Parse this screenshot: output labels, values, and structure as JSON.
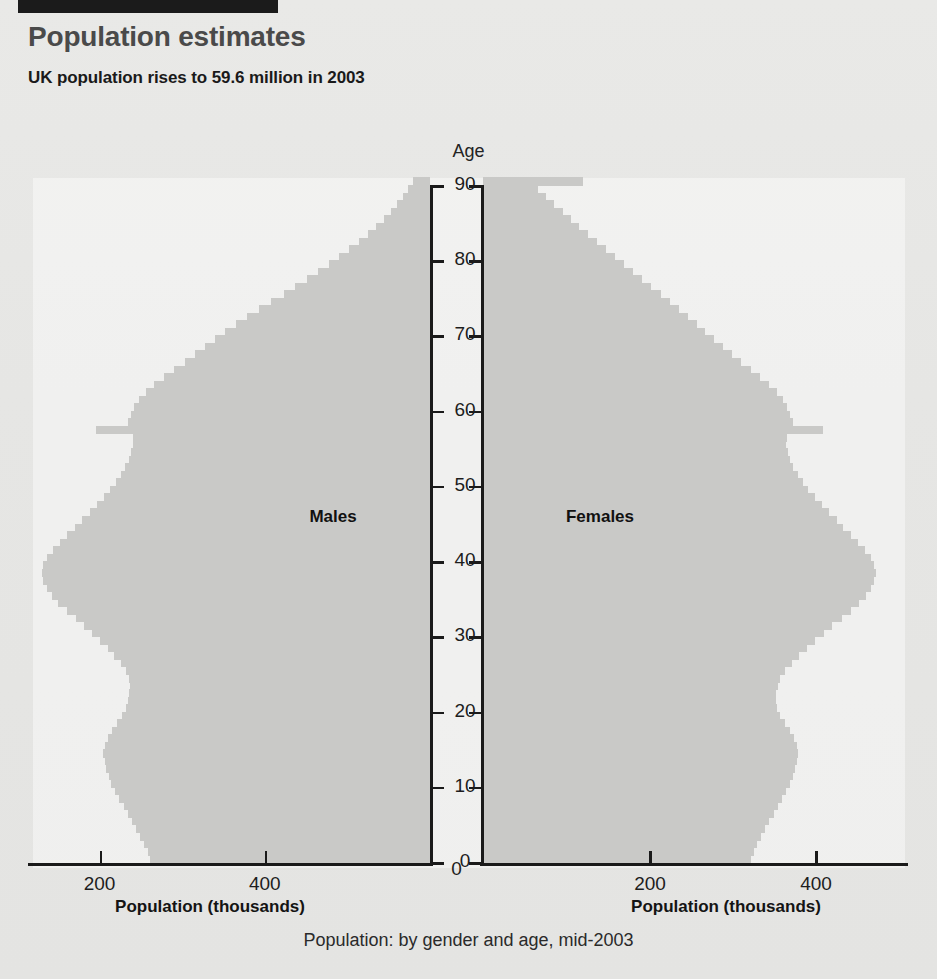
{
  "header": {
    "title": "Population estimates",
    "subtitle": "UK population rises to 59.6 million in 2003"
  },
  "caption": "Population: by gender and age, mid-2003",
  "colors": {
    "bar_fill": "#c9c9c7",
    "axis": "#1a1a1a",
    "title_text": "#4a4a4a",
    "body_text": "#1a1a1a",
    "page_background": "#e8e8e6",
    "plot_background": "#f4f4f2",
    "rule_bar": "#1b1b1b"
  },
  "chart_data": {
    "type": "bar",
    "orientation": "horizontal",
    "subtype": "population-pyramid",
    "title": "Population: by gender and age, mid-2003",
    "ylabel": "Age",
    "xlabel_left": "Population (thousands)",
    "xlabel_right": "Population (thousands)",
    "left_series_label": "Males",
    "right_series_label": "Females",
    "grid": false,
    "legend_position": "inside-panels",
    "ylim": [
      0,
      90
    ],
    "ytick_labels": [
      "0",
      "10",
      "20",
      "30",
      "40",
      "50",
      "60",
      "70",
      "80",
      "90"
    ],
    "yticks": [
      0,
      10,
      20,
      30,
      40,
      50,
      60,
      70,
      80,
      90
    ],
    "xlim_left": [
      0,
      480
    ],
    "xlim_right": [
      0,
      500
    ],
    "xticks_left": [
      200,
      400
    ],
    "xtick_labels_left": [
      "400",
      "200"
    ],
    "xticks_right": [
      200,
      400
    ],
    "xtick_labels_right": [
      "200",
      "400"
    ],
    "xtick_zero_label": "0",
    "ages": [
      0,
      1,
      2,
      3,
      4,
      5,
      6,
      7,
      8,
      9,
      10,
      11,
      12,
      13,
      14,
      15,
      16,
      17,
      18,
      19,
      20,
      21,
      22,
      23,
      24,
      25,
      26,
      27,
      28,
      29,
      30,
      31,
      32,
      33,
      34,
      35,
      36,
      37,
      38,
      39,
      40,
      41,
      42,
      43,
      44,
      45,
      46,
      47,
      48,
      49,
      50,
      51,
      52,
      53,
      54,
      55,
      56,
      57,
      58,
      59,
      60,
      61,
      62,
      63,
      64,
      65,
      66,
      67,
      68,
      69,
      70,
      71,
      72,
      73,
      74,
      75,
      76,
      77,
      78,
      79,
      80,
      81,
      82,
      83,
      84,
      85,
      86,
      87,
      88,
      89,
      90
    ],
    "series": [
      {
        "name": "Males",
        "side": "left",
        "values": [
          339,
          342,
          346,
          351,
          356,
          361,
          366,
          371,
          376,
          381,
          386,
          389,
          392,
          394,
          396,
          394,
          390,
          385,
          379,
          373,
          368,
          366,
          364,
          363,
          364,
          368,
          374,
          382,
          390,
          399,
          409,
          419,
          429,
          440,
          450,
          458,
          464,
          468,
          470,
          468,
          464,
          457,
          448,
          439,
          430,
          421,
          412,
          403,
          395,
          387,
          380,
          374,
          369,
          365,
          362,
          360,
          360,
          404,
          366,
          362,
          358,
          352,
          344,
          334,
          322,
          310,
          297,
          284,
          272,
          260,
          248,
          235,
          221,
          207,
          192,
          177,
          163,
          149,
          135,
          122,
          110,
          98,
          86,
          75,
          65,
          56,
          47,
          40,
          33,
          27,
          21
        ]
      },
      {
        "name": "Females",
        "side": "right",
        "values": [
          323,
          326,
          330,
          335,
          340,
          345,
          350,
          355,
          360,
          365,
          370,
          373,
          376,
          378,
          380,
          378,
          375,
          370,
          364,
          358,
          354,
          353,
          353,
          355,
          358,
          364,
          372,
          381,
          390,
          400,
          411,
          421,
          432,
          443,
          453,
          461,
          467,
          471,
          473,
          471,
          467,
          460,
          452,
          443,
          434,
          426,
          417,
          408,
          400,
          392,
          385,
          379,
          374,
          370,
          367,
          365,
          366,
          410,
          373,
          370,
          366,
          361,
          354,
          345,
          334,
          323,
          311,
          300,
          289,
          278,
          268,
          258,
          247,
          236,
          225,
          214,
          203,
          192,
          181,
          170,
          159,
          148,
          137,
          126,
          116,
          106,
          96,
          86,
          76,
          66,
          120
        ]
      }
    ],
    "notes": {
      "baby_boom_spike_age": 57,
      "description": "Symmetric population pyramid with a pronounced single-year spike at age 57 (1946 post-war baby boom), a broad bulge around ages 34-40 (1960s boom), a dip at ages 20-26, and a 90+ open-ended top bar on the female side."
    }
  },
  "geometry": {
    "center_left_axis_x": 430,
    "center_right_axis_x": 483,
    "plot_top_y": 185,
    "plot_bottom_y": 862,
    "px_per_year": 7.52,
    "px_per_thousand_left": 0.826,
    "px_per_thousand_right": 0.83
  }
}
